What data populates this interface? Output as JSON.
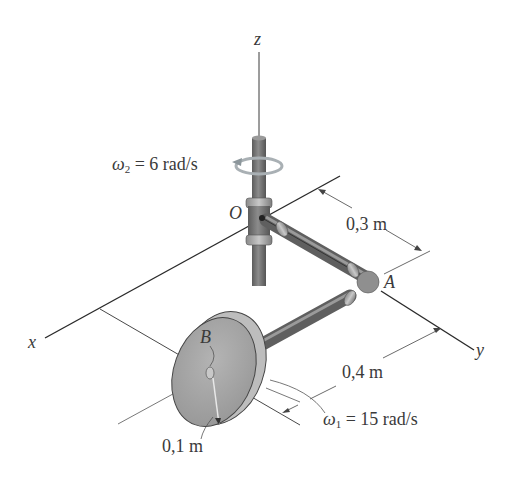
{
  "figure": {
    "axes": {
      "x": "x",
      "y": "y",
      "z": "z"
    },
    "points": {
      "origin": "O",
      "elbow": "A",
      "disk_center": "B"
    },
    "annotations": {
      "omega2": {
        "symbol": "ω",
        "sub": "2",
        "value": "= 6 rad/s"
      },
      "omega1": {
        "symbol": "ω",
        "sub": "1",
        "value": "= 15 rad/s"
      },
      "dim_OA": "0,3 m",
      "dim_AB": "0,4 m",
      "radius": "0,1 m"
    },
    "colors": {
      "line": "#2a2a2a",
      "pipe": "#7d7d7d",
      "pipe_dark": "#5a5a5a",
      "pipe_light": "#b5b5b5",
      "disk_face": "#a8a8a8",
      "disk_rim": "#c9c9c9",
      "arrow_ring": "#9aa3a8"
    }
  }
}
